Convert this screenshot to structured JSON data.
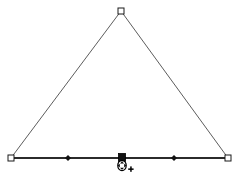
{
  "app": {
    "title": "Triangle Path Edit Canvas",
    "background_color": "#ffffff",
    "canvas_width": 243,
    "canvas_height": 178
  },
  "style": {
    "edge_stroke_color": "#4a4a4a",
    "edge_stroke_width": 0.9,
    "base_stroke_color": "#2b2b2b",
    "base_stroke_width": 1.9,
    "handle_fill": "#ffffff",
    "handle_stroke": "#1a1a1a",
    "selected_node_fill": "#111111",
    "midpoint_marker_fill": "#111111",
    "cursor_outline_color": "#000000",
    "cursor_fill_color": "#ffffff"
  },
  "shape": {
    "name": "triangle",
    "type": "closed-path",
    "vertices": [
      {
        "id": "apex",
        "label": "Apex vertex",
        "x": 121,
        "y": 11
      },
      {
        "id": "base-right",
        "label": "Right base vertex",
        "x": 228,
        "y": 158
      },
      {
        "id": "base-left",
        "label": "Left base vertex",
        "x": 11,
        "y": 158
      }
    ],
    "edges": [
      {
        "id": "left-edge",
        "label": "Left edge",
        "from": "base-left",
        "to": "apex",
        "weight": "thin"
      },
      {
        "id": "right-edge",
        "label": "Right edge",
        "from": "apex",
        "to": "base-right",
        "weight": "thin"
      },
      {
        "id": "base-edge",
        "label": "Base edge",
        "from": "base-left",
        "to": "base-right",
        "weight": "thick"
      }
    ]
  },
  "handles": {
    "vertex_size": 6,
    "items": [
      {
        "id": "handle-apex",
        "name": "apex",
        "shape": "square-hollow",
        "x": 121,
        "y": 11
      },
      {
        "id": "handle-base-left",
        "name": "base-left",
        "shape": "square-hollow",
        "x": 11,
        "y": 158
      },
      {
        "id": "handle-base-right",
        "name": "base-right",
        "shape": "square-hollow",
        "x": 228,
        "y": 158
      }
    ]
  },
  "midpoints": {
    "marker_size": 3,
    "items": [
      {
        "id": "midpoint-left",
        "name": "base-left-midpoint",
        "shape": "diamond-filled",
        "x": 68,
        "y": 158
      },
      {
        "id": "midpoint-right",
        "name": "base-right-midpoint",
        "shape": "diamond-filled",
        "x": 174,
        "y": 158
      }
    ]
  },
  "selection": {
    "active_node": {
      "id": "node-base-center",
      "name": "base-center-node",
      "shape": "square-filled",
      "state": "selected",
      "x": 122,
      "y": 157,
      "size": 7
    }
  },
  "cursor": {
    "id": "move-add-cursor",
    "type": "move",
    "modifier": "add",
    "modifier_glyph": "+",
    "x": 122,
    "y": 166,
    "hotspot_x": 122,
    "hotspot_y": 160
  }
}
